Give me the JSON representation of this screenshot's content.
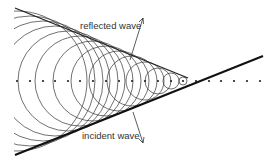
{
  "diagram": {
    "title": "",
    "labels": {
      "reflected": "reflected wave",
      "incident": "incident wave"
    },
    "colors": {
      "stroke": "#333333",
      "background": "#ffffff"
    },
    "axis_y": 81,
    "dots_x": [
      17,
      30,
      43,
      55,
      68,
      80,
      93,
      106,
      119,
      132,
      145,
      158,
      171,
      183,
      196,
      209,
      221,
      234,
      247,
      260
    ],
    "circles": [
      {
        "cx": 17,
        "r": 70
      },
      {
        "cx": 30,
        "r": 65
      },
      {
        "cx": 43,
        "r": 60
      },
      {
        "cx": 55,
        "r": 55
      },
      {
        "cx": 68,
        "r": 50
      },
      {
        "cx": 80,
        "r": 45
      },
      {
        "cx": 93,
        "r": 40
      },
      {
        "cx": 106,
        "r": 35
      },
      {
        "cx": 119,
        "r": 30
      },
      {
        "cx": 132,
        "r": 25
      },
      {
        "cx": 145,
        "r": 19
      },
      {
        "cx": 158,
        "r": 13
      },
      {
        "cx": 171,
        "r": 8
      },
      {
        "cx": 183,
        "r": 4
      }
    ]
  }
}
